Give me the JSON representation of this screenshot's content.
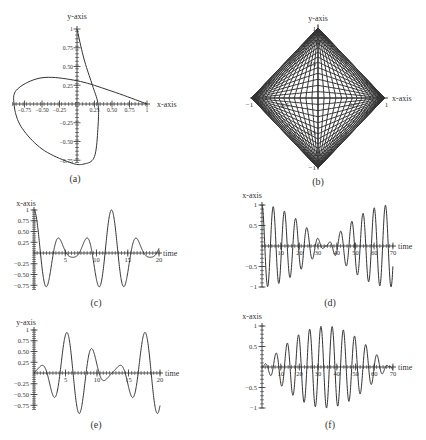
{
  "chart_data": [
    {
      "id": "a",
      "type": "line",
      "caption": "(a)",
      "xlabel": "x-axis",
      "ylabel": "y-axis",
      "xlim": [
        -1,
        1
      ],
      "ylim": [
        -0.8,
        1
      ],
      "xticks": [
        "-0.75",
        "-0.50",
        "-0.25",
        "0.25",
        "0.50",
        "0.75",
        "1"
      ],
      "yticks": [
        "1",
        "0.75",
        "0.50",
        "0.25",
        "-0.25",
        "-0.50",
        "-0.75"
      ],
      "description": "Parametric closed curve (x(t), y(t)); starts at (1,0), loops left through (-0.9, 0), down to (0.05,-0.8), up to (0,1) and back to (1,0)",
      "points": [
        [
          1,
          0
        ],
        [
          0.5,
          0.17
        ],
        [
          0,
          0.31
        ],
        [
          -0.5,
          0.35
        ],
        [
          -0.85,
          0.2
        ],
        [
          -0.9,
          0
        ],
        [
          -0.8,
          -0.3
        ],
        [
          -0.5,
          -0.6
        ],
        [
          -0.1,
          -0.78
        ],
        [
          0.1,
          -0.8
        ],
        [
          0.25,
          -0.7
        ],
        [
          0.3,
          -0.3
        ],
        [
          0.3,
          0
        ],
        [
          0.22,
          0.25
        ],
        [
          0.1,
          0.6
        ],
        [
          0,
          1
        ]
      ]
    },
    {
      "id": "b",
      "type": "line",
      "caption": "(b)",
      "xlabel": "x-axis",
      "ylabel": "y-axis",
      "xlim": [
        -1,
        1
      ],
      "ylim": [
        -1,
        1
      ],
      "xticks": [
        "-1",
        "-0.5",
        "0.5",
        "1"
      ],
      "yticks": [
        "1",
        "0.5",
        "-0.5",
        "-1"
      ],
      "description": "Lissajous-like dense mesh filling a diamond |x|+|y|<=1"
    },
    {
      "id": "c",
      "type": "line",
      "caption": "(c)",
      "xlabel": "time",
      "ylabel": "x-axis",
      "xlim": [
        0,
        20
      ],
      "ylim": [
        -0.85,
        1
      ],
      "xticks": [
        "5",
        "10",
        "15",
        "20"
      ],
      "yticks": [
        "1",
        "0.75",
        "0.50",
        "0.25",
        "-0.25",
        "-0.50",
        "-0.75"
      ],
      "points": [
        [
          0,
          1
        ],
        [
          1,
          0
        ],
        [
          2.2,
          -0.85
        ],
        [
          3.5,
          0
        ],
        [
          4.3,
          0.35
        ],
        [
          5.3,
          0.05
        ],
        [
          6.2,
          0
        ],
        [
          7.2,
          0.35
        ],
        [
          8.2,
          0
        ],
        [
          9.5,
          -0.85
        ],
        [
          11,
          0
        ],
        [
          12.4,
          1
        ],
        [
          13.8,
          0
        ],
        [
          15.1,
          -0.85
        ],
        [
          16.3,
          0
        ],
        [
          17.2,
          0.35
        ],
        [
          18.2,
          0.05
        ],
        [
          19,
          0
        ],
        [
          20,
          0.25
        ]
      ]
    },
    {
      "id": "d",
      "type": "line",
      "caption": "(d)",
      "xlabel": "time",
      "ylabel": "x-axis",
      "xlim": [
        0,
        70
      ],
      "ylim": [
        -1,
        1
      ],
      "xticks": [
        "10",
        "20",
        "30",
        "40",
        "50",
        "60",
        "70"
      ],
      "yticks": [
        "1",
        "0.5",
        "-0.5",
        "-1"
      ],
      "description": "Beating oscillation: amplitude decays from 1 to ~0 near t=33 then grows back to 1 by t=68"
    },
    {
      "id": "e",
      "type": "line",
      "caption": "(e)",
      "xlabel": "time",
      "ylabel": "y-axis",
      "xlim": [
        0,
        20
      ],
      "ylim": [
        -0.85,
        1
      ],
      "xticks": [
        "5",
        "10",
        "15",
        "20"
      ],
      "yticks": [
        "1",
        "0.75",
        "0.50",
        "0.25",
        "-0.25",
        "-0.50",
        "-0.75"
      ],
      "points": [
        [
          0,
          0
        ],
        [
          1,
          0.35
        ],
        [
          2,
          0.05
        ],
        [
          2.6,
          0
        ],
        [
          4,
          -0.85
        ],
        [
          5.4,
          0
        ],
        [
          6.6,
          1
        ],
        [
          7.8,
          0
        ],
        [
          9.2,
          -0.85
        ],
        [
          10.4,
          0
        ],
        [
          11.2,
          0.35
        ],
        [
          12.2,
          0.05
        ],
        [
          12.8,
          0
        ],
        [
          13.8,
          0.35
        ],
        [
          14.8,
          0
        ],
        [
          16.2,
          -0.85
        ],
        [
          17.6,
          0
        ],
        [
          18.8,
          1
        ],
        [
          20,
          0.1
        ]
      ]
    },
    {
      "id": "f",
      "type": "line",
      "caption": "(f)",
      "xlabel": "time",
      "ylabel": "x-axis",
      "xlim": [
        0,
        70
      ],
      "ylim": [
        -1,
        1
      ],
      "xticks": [
        "10",
        "20",
        "30",
        "40",
        "50",
        "60",
        "70"
      ],
      "yticks": [
        "1",
        "0.5",
        "-0.5",
        "-1"
      ],
      "description": "Beating oscillation: amplitude grows from ~0 at t=0 to 1 near t=33 then decays to ~0 near t=68"
    }
  ],
  "captions": {
    "a": "(a)",
    "b": "(b)",
    "c": "(c)",
    "d": "(d)",
    "e": "(e)",
    "f": "(f)"
  },
  "labels": {
    "x_axis": "x-axis",
    "y_axis": "y-axis",
    "time": "time"
  }
}
